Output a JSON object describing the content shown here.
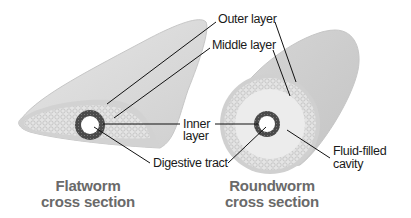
{
  "labels": {
    "outer_layer": "Outer layer",
    "middle_layer": "Middle layer",
    "inner_layer_line1": "Inner",
    "inner_layer_line2": "layer",
    "digestive_tract": "Digestive tract",
    "fluid_cavity_line1": "Fluid-filled",
    "fluid_cavity_line2": "cavity"
  },
  "titles": {
    "flatworm_line1": "Flatworm",
    "flatworm_line2": "cross section",
    "roundworm_line1": "Roundworm",
    "roundworm_line2": "cross section"
  },
  "colors": {
    "body_fill": "#dcdcdc",
    "body_shade": "#c8c8c8",
    "tissue": "#e6e6e6",
    "ring": "#4a4a4a",
    "leader_line": "#111111",
    "title_text": "#6a6a6a"
  }
}
